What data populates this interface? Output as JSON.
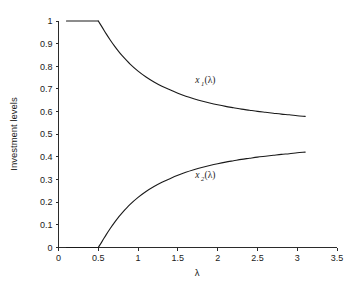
{
  "chart_data": {
    "type": "line",
    "title": "",
    "subtitle": "",
    "xlabel": "λ",
    "ylabel": "Investment levels",
    "xlim": [
      0,
      3.5
    ],
    "ylim": [
      0,
      1
    ],
    "grid": false,
    "legend_position": "inline-annotations",
    "axis_style": "open-L (left and bottom spines only)",
    "xticks": [
      0,
      0.5,
      1,
      1.5,
      2,
      2.5,
      3,
      3.5
    ],
    "xticklabels": [
      "0",
      "0.5",
      "1",
      "1.5",
      "2",
      "2.5",
      "3",
      "3.5"
    ],
    "yticks": [
      0,
      0.1,
      0.2,
      0.3,
      0.4,
      0.5,
      0.6,
      0.7,
      0.8,
      0.9,
      1
    ],
    "yticklabels": [
      "0",
      "0.1",
      "0.2",
      "0.3",
      "0.4",
      "0.5",
      "0.6",
      "0.7",
      "0.8",
      "0.9",
      "1"
    ],
    "annotations": [
      {
        "text": "x_1(λ)",
        "base": "x",
        "sub": "1",
        "tail": "(λ)",
        "x": 1.72,
        "y": 0.725
      },
      {
        "text": "x_2(λ)",
        "base": "x",
        "sub": "2",
        "tail": "(λ)",
        "x": 1.72,
        "y": 0.305
      }
    ],
    "series": [
      {
        "name": "x_1(λ)",
        "color": "#1a1a1a",
        "x": [
          0.1,
          0.2,
          0.3,
          0.4,
          0.5,
          0.55,
          0.6,
          0.65,
          0.7,
          0.75,
          0.8,
          0.9,
          1.0,
          1.1,
          1.2,
          1.3,
          1.4,
          1.5,
          1.6,
          1.7,
          1.8,
          1.9,
          2.0,
          2.1,
          2.2,
          2.3,
          2.4,
          2.5,
          2.6,
          2.7,
          2.8,
          2.9,
          3.0,
          3.1
        ],
        "y": [
          1.0,
          1.0,
          1.0,
          1.0,
          1.0,
          0.972,
          0.943,
          0.916,
          0.891,
          0.868,
          0.847,
          0.81,
          0.779,
          0.753,
          0.731,
          0.712,
          0.696,
          0.681,
          0.668,
          0.657,
          0.647,
          0.638,
          0.63,
          0.623,
          0.617,
          0.611,
          0.606,
          0.601,
          0.597,
          0.593,
          0.589,
          0.586,
          0.582,
          0.579
        ]
      },
      {
        "name": "x_2(λ)",
        "color": "#1a1a1a",
        "x": [
          0.1,
          0.2,
          0.3,
          0.4,
          0.5,
          0.55,
          0.6,
          0.65,
          0.7,
          0.75,
          0.8,
          0.9,
          1.0,
          1.1,
          1.2,
          1.3,
          1.4,
          1.5,
          1.6,
          1.7,
          1.8,
          1.9,
          2.0,
          2.1,
          2.2,
          2.3,
          2.4,
          2.5,
          2.6,
          2.7,
          2.8,
          2.9,
          3.0,
          3.1
        ],
        "y": [
          0.0,
          0.0,
          0.0,
          0.0,
          0.0,
          0.028,
          0.057,
          0.084,
          0.109,
          0.132,
          0.153,
          0.19,
          0.221,
          0.247,
          0.269,
          0.288,
          0.304,
          0.319,
          0.332,
          0.343,
          0.353,
          0.362,
          0.37,
          0.377,
          0.383,
          0.389,
          0.394,
          0.399,
          0.403,
          0.407,
          0.411,
          0.414,
          0.418,
          0.421
        ]
      }
    ]
  },
  "figure": {
    "background": "#ffffff",
    "foreground": "#1a1a1a"
  }
}
